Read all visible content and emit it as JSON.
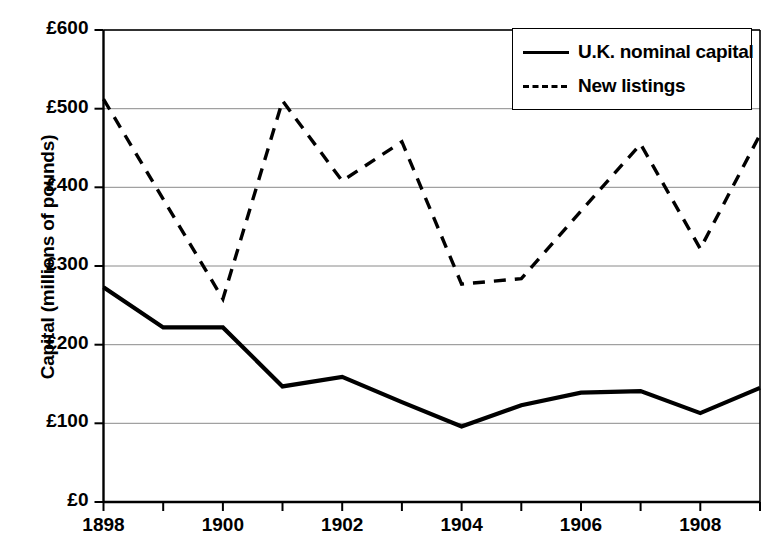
{
  "chart_data": {
    "type": "line",
    "title": "",
    "xlabel": "",
    "ylabel": "Capital (millions of pounds)",
    "x": [
      1898,
      1899,
      1900,
      1901,
      1902,
      1903,
      1904,
      1905,
      1906,
      1907,
      1908,
      1909
    ],
    "xlim": [
      1898,
      1909
    ],
    "ylim": [
      0,
      600
    ],
    "grid": true,
    "legend_position": "top-right",
    "y_tick_labels": [
      "£0",
      "£100",
      "£200",
      "£300",
      "£400",
      "£500",
      "£600"
    ],
    "y_tick_values": [
      0,
      100,
      200,
      300,
      400,
      500,
      600
    ],
    "x_tick_labels": [
      "1898",
      "1900",
      "1902",
      "1904",
      "1906",
      "1908"
    ],
    "x_tick_values": [
      1898,
      1900,
      1902,
      1904,
      1906,
      1908
    ],
    "x_minor_ticks": [
      1899,
      1901,
      1903,
      1905,
      1907,
      1909
    ],
    "series": [
      {
        "name": "U.K. nominal capital",
        "style": "solid",
        "color": "#000000",
        "values": [
          273,
          222,
          222,
          147,
          159,
          127,
          96,
          123,
          139,
          141,
          113,
          145
        ]
      },
      {
        "name": "New listings",
        "style": "dashed",
        "color": "#000000",
        "values": [
          512,
          385,
          258,
          510,
          408,
          458,
          277,
          284,
          370,
          455,
          322,
          467
        ]
      }
    ]
  },
  "legend": {
    "entries": [
      {
        "label": "U.K. nominal capital",
        "style": "solid"
      },
      {
        "label": "New listings",
        "style": "dashed"
      }
    ]
  }
}
